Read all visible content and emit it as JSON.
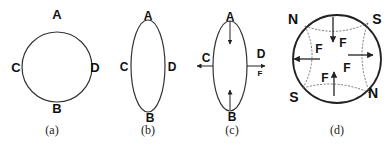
{
  "figure": {
    "panels": [
      {
        "id": "a",
        "caption": "(a)",
        "shape": "circle",
        "labels": {
          "top": "A",
          "bottom": "B",
          "left": "C",
          "right": "D"
        }
      },
      {
        "id": "b",
        "caption": "(b)",
        "shape": "vertical-ellipse",
        "labels": {
          "top": "A",
          "bottom": "B",
          "left": "C",
          "right": "D"
        }
      },
      {
        "id": "c",
        "caption": "(c)",
        "shape": "vertical-ellipse-with-forces",
        "labels": {
          "top": "A",
          "bottom": "B",
          "left": "C",
          "right": "D",
          "force": "F"
        }
      },
      {
        "id": "d",
        "caption": "(d)",
        "shape": "circle-with-quadrupole-field",
        "poles": {
          "top_left": "N",
          "top_right": "S",
          "bottom_left": "S",
          "bottom_right": "N"
        },
        "force_label": "F"
      }
    ]
  },
  "colors": {
    "stroke": "#222222",
    "text": "#111111",
    "background": "#ffffff"
  }
}
